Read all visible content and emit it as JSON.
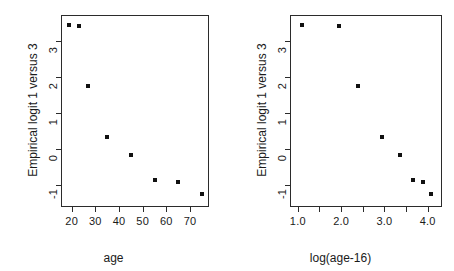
{
  "figure": {
    "background": "#ffffff",
    "point_color": "#111111",
    "axis_color": "#2b2b2b",
    "panel_count": 2
  },
  "chart_data": [
    {
      "type": "scatter",
      "panel": "left",
      "title": "",
      "xlabel": "age",
      "ylabel": "Empirical logit 1 versus 3",
      "xlim": [
        15.5,
        78.0
      ],
      "ylim": [
        -1.62,
        3.72
      ],
      "grid": false,
      "legend": null,
      "xticks": [
        20,
        30,
        40,
        50,
        60,
        70
      ],
      "xticklabels": [
        "20",
        "30",
        "40",
        "50",
        "60",
        "70"
      ],
      "yticks": [
        -1,
        0,
        1,
        2,
        3
      ],
      "yticklabels": [
        "-1",
        "0",
        "1",
        "2",
        "3"
      ],
      "marker": "square",
      "x": [
        19.0,
        23.0,
        27.0,
        35.0,
        45.0,
        55.0,
        65.0,
        75.0
      ],
      "y": [
        3.45,
        3.42,
        1.75,
        0.33,
        -0.17,
        -0.88,
        -0.93,
        -1.27
      ]
    },
    {
      "type": "scatter",
      "panel": "right",
      "title": "",
      "xlabel": "log(age-16)",
      "ylabel": "Empirical logit 1 versus 3",
      "xlim": [
        0.82,
        4.33
      ],
      "ylim": [
        -1.62,
        3.72
      ],
      "grid": false,
      "legend": null,
      "xticks": [
        1.0,
        1.5,
        2.0,
        2.5,
        3.0,
        3.5,
        4.0
      ],
      "xticklabels": [
        "1.0",
        "",
        "2.0",
        "",
        "3.0",
        "",
        "4.0"
      ],
      "yticks": [
        -1,
        0,
        1,
        2,
        3
      ],
      "yticklabels": [
        "-1",
        "0",
        "1",
        "2",
        "3"
      ],
      "marker": "square",
      "x": [
        1.1,
        1.95,
        2.4,
        2.94,
        3.37,
        3.66,
        3.89,
        4.08
      ],
      "y": [
        3.45,
        3.42,
        1.75,
        0.33,
        -0.17,
        -0.88,
        -0.93,
        -1.27
      ]
    }
  ]
}
